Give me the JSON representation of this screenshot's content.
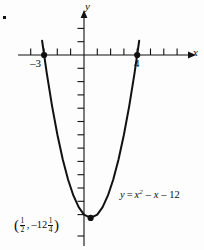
{
  "figure": {
    "background_color": "#fdfdfd",
    "ink_color": "#111111",
    "corner_mark": "bullet-mark"
  },
  "axes": {
    "x_label": "x",
    "y_label": "y",
    "origin_px": [
      84,
      55
    ],
    "unit_px": 13.3,
    "x_axis_y_px": 55,
    "y_axis_x_px": 84,
    "x_tick_count": 13,
    "y_tick_count_below": 13,
    "y_tick_count_above": 2,
    "grid": "off"
  },
  "annotations": {
    "root_left_label": "–3",
    "root_right_label": "4",
    "equation_lhs": "y",
    "equation_eq": "=",
    "equation_term1": "x",
    "equation_exp": "2",
    "equation_term2": "– x",
    "equation_term3": "– 12",
    "vertex_open_paren": "(",
    "vertex_x_num": "1",
    "vertex_x_den": "2",
    "vertex_comma": ",",
    "vertex_y_sign": "–12",
    "vertex_y_num": "1",
    "vertex_y_den": "4",
    "vertex_close_paren": ")"
  },
  "chart_data": {
    "type": "line",
    "title": "",
    "xlabel": "x",
    "ylabel": "y",
    "equation": "y = x^2 - x - 12",
    "curve_name": "parabola",
    "roots": [
      -3,
      4
    ],
    "vertex": [
      0.5,
      -12.25
    ],
    "y_intercept": -12,
    "xlim": [
      -6.3,
      8.2
    ],
    "ylim": [
      -14.6,
      4.1
    ],
    "grid": false,
    "legend": "none",
    "marked_points": [
      {
        "label": "–3",
        "x": -3,
        "y": 0
      },
      {
        "label": "4",
        "x": 4,
        "y": 0
      },
      {
        "label": "(1/2, –12 1/4)",
        "x": 0.5,
        "y": -12.25
      }
    ],
    "x": [
      -3.15,
      -2.8,
      -2.4,
      -2.0,
      -1.6,
      -1.2,
      -0.8,
      -0.4,
      0.0,
      0.5,
      1.0,
      1.4,
      1.8,
      2.2,
      2.6,
      3.0,
      3.4,
      3.8,
      4.15
    ],
    "y": [
      -2.13,
      -5.36,
      -7.84,
      -10.0,
      -11.84,
      -13.36,
      -12.56,
      -11.44,
      -12.0,
      -12.25,
      -12.0,
      -11.44,
      -10.56,
      -9.36,
      -7.84,
      -6.0,
      -3.84,
      -1.36,
      0.07
    ]
  }
}
